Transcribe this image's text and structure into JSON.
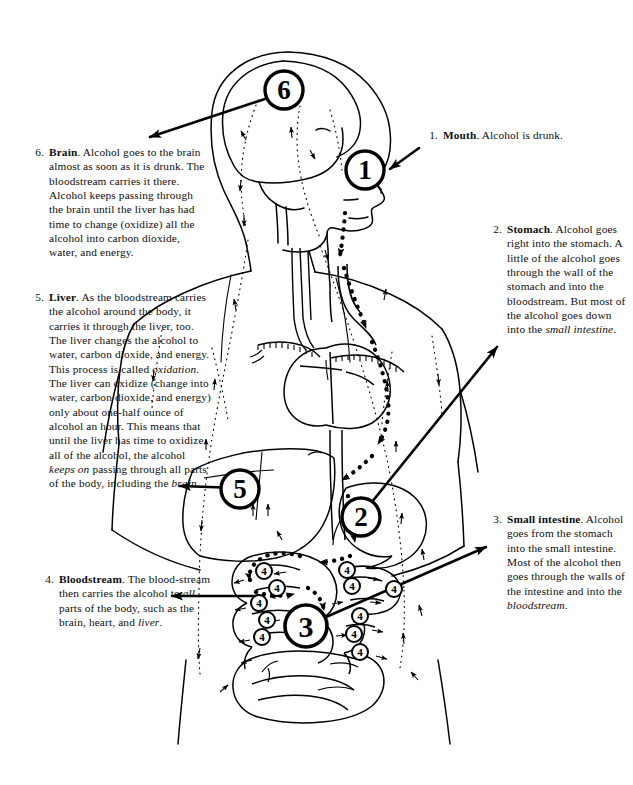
{
  "document": {
    "title": "How alcohol travels through the body",
    "type": "anatomical-diagram",
    "background_color": "#ffffff",
    "ink_color": "#000000"
  },
  "figure": {
    "organs": [
      "brain",
      "mouth",
      "esophagus",
      "heart",
      "aorta",
      "liver",
      "stomach",
      "small intestine",
      "large intestine"
    ],
    "path_style": "dotted arrows"
  },
  "markers": [
    {
      "id": "marker-1",
      "label": "1",
      "organ": "mouth",
      "x": 365,
      "y": 170,
      "r": 19
    },
    {
      "id": "marker-2",
      "label": "2",
      "organ": "stomach",
      "x": 361,
      "y": 517,
      "r": 19
    },
    {
      "id": "marker-3",
      "label": "3",
      "organ": "small intestine",
      "x": 306,
      "y": 626,
      "r": 21
    },
    {
      "id": "marker-5",
      "label": "5",
      "organ": "liver",
      "x": 240,
      "y": 489,
      "r": 19
    },
    {
      "id": "marker-6",
      "label": "6",
      "organ": "brain",
      "x": 284,
      "y": 90,
      "r": 19
    }
  ],
  "bloodstream_markers": {
    "label": "4",
    "count": 11,
    "radius": 8,
    "positions": [
      {
        "x": 264,
        "y": 571
      },
      {
        "x": 277,
        "y": 588
      },
      {
        "x": 259,
        "y": 603
      },
      {
        "x": 267,
        "y": 620
      },
      {
        "x": 262,
        "y": 637
      },
      {
        "x": 347,
        "y": 570
      },
      {
        "x": 352,
        "y": 586
      },
      {
        "x": 360,
        "y": 616
      },
      {
        "x": 354,
        "y": 634
      },
      {
        "x": 360,
        "y": 652
      },
      {
        "x": 394,
        "y": 589
      }
    ]
  },
  "callouts": {
    "mouth": {
      "number": "1.",
      "term": "Mouth",
      "text": ". Alcohol is drunk.",
      "full_text": "1. Mouth. Alcohol is drunk."
    },
    "stomach": {
      "number": "2.",
      "term": "Stomach",
      "text": ". Alcohol goes right into the stomach. A little of the alcohol goes through the wall of the stomach and into the bloodstream. But most of the alcohol goes down into the ",
      "emphasis": "small intestine",
      "text_after": ".",
      "full_text": "2. Stomach. Alcohol goes right into the stomach. A little of the alcohol goes through the wall of the stomach and into the bloodstream. But most of the alcohol goes down into the small intestine."
    },
    "small_intestine": {
      "number": "3.",
      "term": "Small intestine",
      "text": ". Alcohol goes from the stomach into the small intestine. Most of the alcohol then goes through the walls of the intestine and into the ",
      "emphasis": "bloodstream",
      "text_after": ".",
      "full_text": "3. Small intestine. Alcohol goes from the stomach into the small intestine. Most of the alcohol then goes through the walls of the intestine and into the bloodstream."
    },
    "bloodstream": {
      "number": "4.",
      "term": "Bloodstream",
      "text": ". The blood-stream then carries the alcohol to ",
      "emphasis": "all",
      "text_mid": " parts of the body, such as the brain, heart, and ",
      "emphasis2": "liver",
      "text_after": ".",
      "full_text": "4. Bloodstream. The bloodstream then carries the alcohol to all parts of the body, such as the brain, heart, and liver."
    },
    "liver": {
      "number": "5.",
      "term": "Liver",
      "text": ". As the bloodstream carries the alcohol around the body, it carries it through the liver, too. The liver changes the alcohol to water, carbon dioxide, and energy. This process is called ",
      "emphasis": "oxidation",
      "text_mid": ". The liver can oxidize (change into water, carbon dioxide, and energy) only about one-half ounce of alcohol an hour. This means that until the liver has time to oxidize all of the alcohol, the alcohol ",
      "emphasis2": "keeps on",
      "text_mid2": " passing through all parts of the body, including the ",
      "emphasis3": "brain",
      "text_after": ".",
      "full_text": "5. Liver. As the bloodstream carries the alcohol around the body, it carries it through the liver, too. The liver changes the alcohol to water, carbon dioxide, and energy. This process is called oxidation. The liver can oxidize (change into water, carbon dioxide, and energy) only about one-half ounce of alcohol an hour. This means that until the liver has time to oxidize all of the alcohol, the alcohol keeps on passing through all parts of the body, including the brain."
    },
    "brain": {
      "number": "6.",
      "term": "Brain",
      "text": ". Alcohol goes to the brain almost as soon as it is drunk. The bloodstream carries it there. Alcohol keeps passing through the brain until the liver has had time to change (oxidize) all the alcohol into carbon dioxide, water, and energy.",
      "full_text": "6. Brain. Alcohol goes to the brain almost as soon as it is drunk. The bloodstream carries it there. Alcohol keeps passing through the brain until the liver has had time to change (oxidize) all the alcohol into carbon dioxide, water, and energy."
    }
  },
  "leader_arrows": [
    {
      "name": "arrow-to-brain-text",
      "from": [
        283,
        93
      ],
      "to": [
        140,
        139
      ],
      "head_at": "to"
    },
    {
      "name": "arrow-to-mouth",
      "from": [
        419,
        149
      ],
      "to": [
        393,
        168
      ],
      "head_at": "from"
    },
    {
      "name": "arrow-to-stomach",
      "from": [
        362,
        516
      ],
      "to": [
        500,
        345
      ],
      "head_at": "to"
    },
    {
      "name": "arrow-to-intestine",
      "from": [
        307,
        626
      ],
      "to": [
        489,
        545
      ],
      "head_at": "to"
    },
    {
      "name": "arrow-to-liver-text",
      "from": [
        239,
        489
      ],
      "to": [
        173,
        485
      ],
      "head_at": "to"
    },
    {
      "name": "arrow-to-bloodstream",
      "from": [
        258,
        596
      ],
      "to": [
        165,
        596
      ],
      "head_at": "to"
    }
  ]
}
